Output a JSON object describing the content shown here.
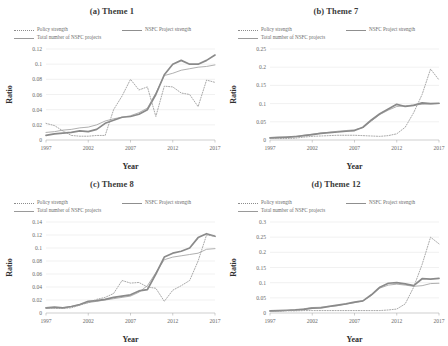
{
  "figure": {
    "caption": "",
    "legend": [
      {
        "label": "Policy strength",
        "style": "dotted",
        "color": "#8c8c8c",
        "icon": "dotted-line-icon"
      },
      {
        "label": "NSFC Project  strength",
        "style": "thick-solid",
        "color": "#8f8f8f",
        "icon": "solid-line-icon"
      },
      {
        "label": "Total number of NSFC projects",
        "style": "thin-solid",
        "color": "#9a9a9a",
        "icon": "thin-line-icon"
      }
    ]
  },
  "chart_data": [
    {
      "type": "line",
      "title": "(a) Theme 1",
      "xlabel": "Year",
      "ylabel": "Ratio",
      "xlim": [
        1997,
        2017
      ],
      "ylim": [
        0,
        0.12
      ],
      "yticks": [
        "0",
        "0.02",
        "0.04",
        "0.06",
        "0.08",
        "0.1",
        "0.12"
      ],
      "ytickvals": [
        0,
        0.02,
        0.04,
        0.06,
        0.08,
        0.1,
        0.12
      ],
      "xticks": [
        "1997",
        "2002",
        "2007",
        "2012",
        "2017"
      ],
      "xtickvals": [
        1997,
        2002,
        2007,
        2012,
        2017
      ],
      "grid": true,
      "legend_position": "above-plot",
      "x": [
        1997,
        1998,
        1999,
        2000,
        2001,
        2002,
        2003,
        2004,
        2005,
        2006,
        2007,
        2008,
        2009,
        2010,
        2011,
        2012,
        2013,
        2014,
        2015,
        2016,
        2017
      ],
      "series": [
        {
          "name": "Policy strength",
          "style": "dotted",
          "values": [
            0.022,
            0.019,
            0.012,
            0.006,
            0.005,
            0.005,
            0.006,
            0.006,
            0.04,
            0.058,
            0.08,
            0.066,
            0.07,
            0.031,
            0.071,
            0.07,
            0.062,
            0.06,
            0.044,
            0.079,
            0.076
          ]
        },
        {
          "name": "NSFC Project  strength",
          "style": "thick-solid",
          "values": [
            0.006,
            0.008,
            0.009,
            0.01,
            0.012,
            0.011,
            0.014,
            0.022,
            0.026,
            0.03,
            0.031,
            0.034,
            0.04,
            0.06,
            0.086,
            0.1,
            0.105,
            0.1,
            0.1,
            0.105,
            0.112
          ]
        },
        {
          "name": "Total number of NSFC projects",
          "style": "thin-solid",
          "values": [
            0.01,
            0.011,
            0.013,
            0.014,
            0.016,
            0.017,
            0.02,
            0.025,
            0.028,
            0.03,
            0.032,
            0.036,
            0.042,
            0.062,
            0.085,
            0.088,
            0.092,
            0.094,
            0.096,
            0.097,
            0.099
          ]
        }
      ]
    },
    {
      "type": "line",
      "title": "(b) Theme 7",
      "xlabel": "Year",
      "ylabel": "Ratio",
      "xlim": [
        1997,
        2017
      ],
      "ylim": [
        0,
        0.25
      ],
      "yticks": [
        "0",
        "0.05",
        "0.1",
        "0.15",
        "0.2",
        "0.25"
      ],
      "ytickvals": [
        0,
        0.05,
        0.1,
        0.15,
        0.2,
        0.25
      ],
      "xticks": [
        "1997",
        "2002",
        "2007",
        "2012",
        "2017"
      ],
      "xtickvals": [
        1997,
        2002,
        2007,
        2012,
        2017
      ],
      "grid": true,
      "legend_position": "above-plot",
      "x": [
        1997,
        1998,
        1999,
        2000,
        2001,
        2002,
        2003,
        2004,
        2005,
        2006,
        2007,
        2008,
        2009,
        2010,
        2011,
        2012,
        2013,
        2014,
        2015,
        2016,
        2017
      ],
      "series": [
        {
          "name": "Policy strength",
          "style": "dotted",
          "values": [
            0.005,
            0.004,
            0.004,
            0.005,
            0.008,
            0.01,
            0.011,
            0.012,
            0.013,
            0.013,
            0.013,
            0.012,
            0.011,
            0.01,
            0.012,
            0.017,
            0.035,
            0.075,
            0.125,
            0.195,
            0.165
          ]
        },
        {
          "name": "NSFC Project  strength",
          "style": "thick-solid",
          "values": [
            0.006,
            0.007,
            0.008,
            0.009,
            0.012,
            0.015,
            0.018,
            0.02,
            0.022,
            0.024,
            0.026,
            0.035,
            0.055,
            0.072,
            0.085,
            0.098,
            0.092,
            0.095,
            0.102,
            0.1,
            0.101
          ]
        },
        {
          "name": "Total number of NSFC projects",
          "style": "thin-solid",
          "values": [
            0.005,
            0.006,
            0.007,
            0.01,
            0.013,
            0.016,
            0.019,
            0.021,
            0.024,
            0.026,
            0.028,
            0.034,
            0.052,
            0.07,
            0.082,
            0.092,
            0.094,
            0.096,
            0.098,
            0.099,
            0.1
          ]
        }
      ]
    },
    {
      "type": "line",
      "title": "(c) Theme 8",
      "xlabel": "Year",
      "ylabel": "Ratio",
      "xlim": [
        1997,
        2017
      ],
      "ylim": [
        0,
        0.14
      ],
      "yticks": [
        "0",
        "0.02",
        "0.04",
        "0.06",
        "0.08",
        "0.1",
        "0.12",
        "0.14"
      ],
      "ytickvals": [
        0,
        0.02,
        0.04,
        0.06,
        0.08,
        0.1,
        0.12,
        0.14
      ],
      "xticks": [
        "1997",
        "2002",
        "2007",
        "2012",
        "2017"
      ],
      "xtickvals": [
        1997,
        2002,
        2007,
        2012,
        2017
      ],
      "grid": true,
      "legend_position": "above-plot",
      "x": [
        1997,
        1998,
        1999,
        2000,
        2001,
        2002,
        2003,
        2004,
        2005,
        2006,
        2007,
        2008,
        2009,
        2010,
        2011,
        2012,
        2013,
        2014,
        2015,
        2016,
        2017
      ],
      "series": [
        {
          "name": "Policy strength",
          "style": "dotted",
          "values": [
            0.008,
            0.007,
            0.007,
            0.008,
            0.012,
            0.016,
            0.021,
            0.024,
            0.03,
            0.05,
            0.046,
            0.047,
            0.04,
            0.038,
            0.018,
            0.035,
            0.042,
            0.05,
            0.08,
            0.12,
            0.118
          ]
        },
        {
          "name": "NSFC Project  strength",
          "style": "thick-solid",
          "values": [
            0.008,
            0.009,
            0.008,
            0.01,
            0.013,
            0.018,
            0.019,
            0.021,
            0.024,
            0.026,
            0.028,
            0.034,
            0.036,
            0.06,
            0.086,
            0.092,
            0.095,
            0.1,
            0.116,
            0.122,
            0.118
          ]
        },
        {
          "name": "Total number of NSFC projects",
          "style": "thin-solid",
          "values": [
            0.007,
            0.008,
            0.008,
            0.01,
            0.013,
            0.016,
            0.018,
            0.02,
            0.022,
            0.024,
            0.026,
            0.032,
            0.042,
            0.062,
            0.082,
            0.086,
            0.088,
            0.09,
            0.092,
            0.098,
            0.099
          ]
        }
      ]
    },
    {
      "type": "line",
      "title": "(d) Theme 12",
      "xlabel": "Year",
      "ylabel": "Ratio",
      "xlim": [
        1997,
        2017
      ],
      "ylim": [
        0,
        0.3
      ],
      "yticks": [
        "0",
        "0.05",
        "0.1",
        "0.15",
        "0.2",
        "0.25",
        "0.3"
      ],
      "ytickvals": [
        0,
        0.05,
        0.1,
        0.15,
        0.2,
        0.25,
        0.3
      ],
      "xticks": [
        "1997",
        "2002",
        "2007",
        "2012",
        "2017"
      ],
      "xtickvals": [
        1997,
        2002,
        2007,
        2012,
        2017
      ],
      "grid": true,
      "legend_position": "above-plot",
      "x": [
        1997,
        1998,
        1999,
        2000,
        2001,
        2002,
        2003,
        2004,
        2005,
        2006,
        2007,
        2008,
        2009,
        2010,
        2011,
        2012,
        2013,
        2014,
        2015,
        2016,
        2017
      ],
      "series": [
        {
          "name": "Policy strength",
          "style": "dotted",
          "values": [
            0.006,
            0.006,
            0.007,
            0.007,
            0.008,
            0.008,
            0.008,
            0.008,
            0.008,
            0.008,
            0.008,
            0.008,
            0.008,
            0.008,
            0.01,
            0.013,
            0.03,
            0.085,
            0.16,
            0.25,
            0.228
          ]
        },
        {
          "name": "NSFC Project  strength",
          "style": "thick-solid",
          "values": [
            0.007,
            0.008,
            0.009,
            0.01,
            0.012,
            0.016,
            0.017,
            0.022,
            0.026,
            0.03,
            0.036,
            0.04,
            0.06,
            0.085,
            0.098,
            0.1,
            0.096,
            0.09,
            0.113,
            0.112,
            0.114
          ]
        },
        {
          "name": "Total number of NSFC projects",
          "style": "thin-solid",
          "values": [
            0.006,
            0.007,
            0.008,
            0.01,
            0.014,
            0.018,
            0.019,
            0.021,
            0.024,
            0.03,
            0.034,
            0.04,
            0.058,
            0.082,
            0.092,
            0.095,
            0.092,
            0.088,
            0.09,
            0.097,
            0.098
          ]
        }
      ]
    }
  ]
}
